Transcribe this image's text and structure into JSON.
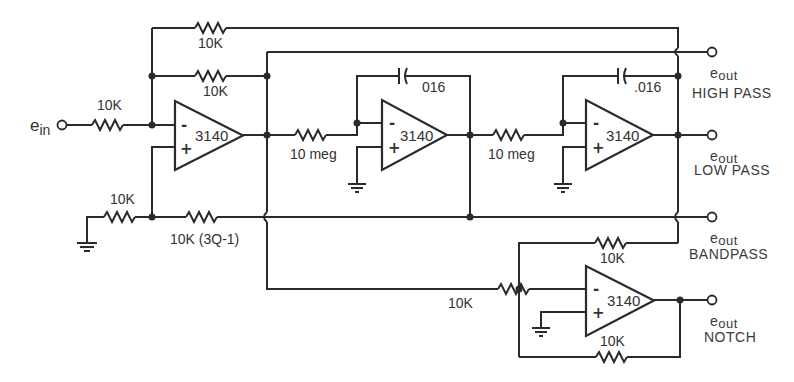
{
  "diagram": {
    "type": "state-variable active filter schematic",
    "input": {
      "label_main": "e",
      "label_sub": "in"
    },
    "op_amps": [
      {
        "id": "U1",
        "label": "3140",
        "inverting": "-",
        "noninverting": "+"
      },
      {
        "id": "U2",
        "label": "3140",
        "inverting": "-",
        "noninverting": "+"
      },
      {
        "id": "U3",
        "label": "3140",
        "inverting": "-",
        "noninverting": "+"
      },
      {
        "id": "U4",
        "label": "3140",
        "inverting": "-",
        "noninverting": "+"
      }
    ],
    "resistors": {
      "r_input": "10K",
      "r_top_feedback": "10K",
      "r_feedback": "10K",
      "r_ground": "10K",
      "r_q": "10K (3Q-1)",
      "r_int1": "10 meg",
      "r_int2": "10 meg",
      "r_notch_in": "10K",
      "r_notch_bp": "10K",
      "r_notch_fb": "10K"
    },
    "capacitors": {
      "c1": "016",
      "c2": ".016"
    },
    "outputs": [
      {
        "label_main": "e",
        "label_sub": "out",
        "name": "HIGH PASS"
      },
      {
        "label_main": "e",
        "label_sub": "out",
        "name": "LOW PASS"
      },
      {
        "label_main": "e",
        "label_sub": "out",
        "name": "BANDPASS"
      },
      {
        "label_main": "e",
        "label_sub": "out",
        "name": "NOTCH"
      }
    ]
  }
}
